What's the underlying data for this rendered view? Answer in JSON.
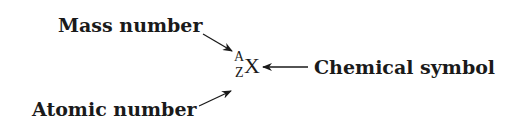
{
  "labels": {
    "mass_number": "Mass number",
    "atomic_number": "Atomic number",
    "chemical_symbol": "Chemical symbol"
  },
  "notation": {
    "superscript": "A",
    "subscript": "Z",
    "symbol": "X"
  },
  "colors": {
    "text": "#1a1a1a",
    "background": "#ffffff"
  }
}
